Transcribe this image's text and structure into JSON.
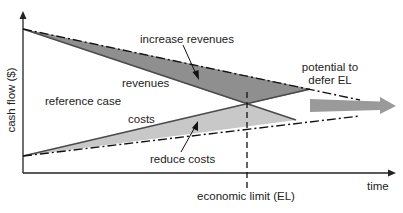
{
  "diagram": {
    "type": "economic-limit-cashflow-diagram",
    "axes": {
      "y_label": "cash flow ($)",
      "x_label": "time"
    },
    "labels": {
      "increase_revenues": "increase revenues",
      "revenues": "revenues",
      "reference_case": "reference case",
      "costs": "costs",
      "reduce_costs": "reduce costs",
      "potential_line1": "potential to",
      "potential_line2": "defer EL",
      "economic_limit": "economic limit (EL)"
    },
    "colors": {
      "axis": "#222222",
      "line": "#3a3a3a",
      "revenue_gain_fill": "#8f8f8f",
      "cost_reduction_fill": "#c8c8c8",
      "defer_arrow": "#9a9a9a"
    }
  }
}
